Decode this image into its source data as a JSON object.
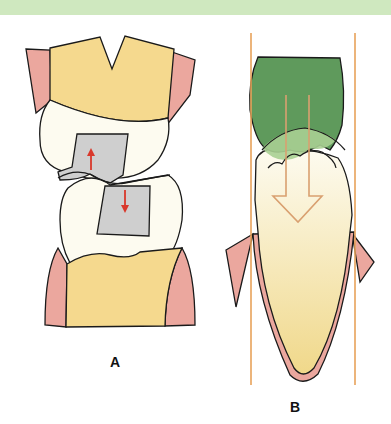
{
  "figure": {
    "panels": [
      {
        "id": "A",
        "label": "A",
        "description": "Opposing molars with inlay restorations; red arrows show vertical forces"
      },
      {
        "id": "B",
        "label": "B",
        "description": "Incisor with restoration; path of insertion lines and hollow arrow"
      }
    ],
    "colors": {
      "header_band": "#cfe8bf",
      "crown_yellow": "#f5d98e",
      "gingiva_pink": "#eba79e",
      "enamel_white": "#fdfbf0",
      "inlay_gray": "#cfcfcf",
      "arrow_red": "#d9382b",
      "restoration_green": "#5f9a5c",
      "guide_orange": "#e8a25a",
      "outline": "#1a1a1a"
    }
  }
}
